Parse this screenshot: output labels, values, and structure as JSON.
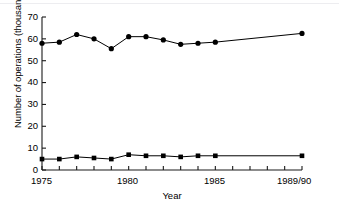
{
  "chart_data": {
    "type": "line",
    "title": "",
    "xlabel": "Year",
    "ylabel": "Number of operations (thousands)",
    "xlim": [
      1975,
      1990
    ],
    "ylim": [
      0,
      70
    ],
    "yticks": [
      0,
      10,
      20,
      30,
      40,
      50,
      60,
      70
    ],
    "ytick_labels": [
      "0",
      "10",
      "20",
      "30",
      "40",
      "50",
      "60",
      "70"
    ],
    "xticks": [
      1975,
      1976,
      1977,
      1978,
      1979,
      1980,
      1981,
      1982,
      1983,
      1984,
      1985,
      1986,
      1987,
      1988,
      1989,
      1990
    ],
    "xtick_labels_shown": [
      {
        "label": "1975",
        "x": 1975
      },
      {
        "label": "1980",
        "x": 1980
      },
      {
        "label": "1985",
        "x": 1985
      },
      {
        "label": "1989/90",
        "x": 1990
      }
    ],
    "grid": false,
    "legend": "none",
    "x": [
      1975,
      1976,
      1977,
      1978,
      1979,
      1980,
      1981,
      1982,
      1983,
      1984,
      1985,
      1990
    ],
    "series": [
      {
        "name": "Upper series",
        "marker": "circle",
        "color": "#000000",
        "values": [
          58.0,
          58.5,
          62.0,
          60.0,
          55.5,
          61.0,
          61.0,
          59.5,
          57.5,
          58.0,
          58.5,
          62.5
        ]
      },
      {
        "name": "Lower series",
        "marker": "square",
        "color": "#000000",
        "values": [
          5.0,
          5.0,
          6.0,
          5.5,
          5.0,
          7.0,
          6.5,
          6.5,
          6.0,
          6.5,
          6.5,
          6.5
        ]
      }
    ]
  },
  "axes": {
    "y_axis_name": "y-axis",
    "x_axis_name": "x-axis"
  }
}
